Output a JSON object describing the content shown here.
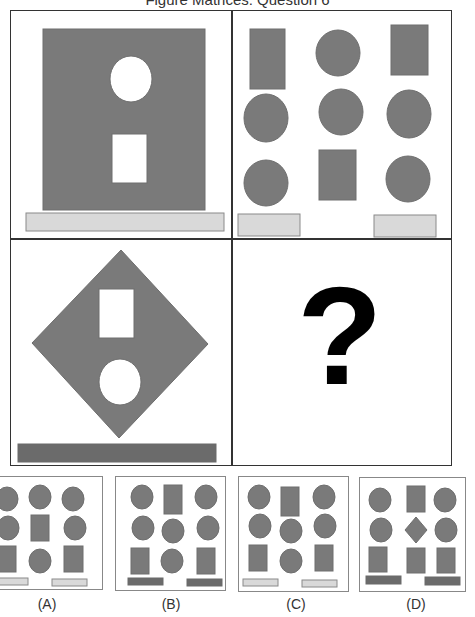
{
  "title": "Figure Matrices: Question 6",
  "colors": {
    "shape_fill": "#7a7a7a",
    "shape_stroke": "#6e6e6e",
    "light_bar_fill": "#d9d9d9",
    "light_bar_stroke": "#8a8a8a",
    "dark_bar_fill": "#6b6b6b",
    "hole_fill": "#ffffff",
    "border": "#333333"
  },
  "matrix": {
    "top_left": {
      "description": "Large gray square containing a white circle above a white rectangle, light bar below",
      "shapes": [
        {
          "type": "rect",
          "x": 32,
          "y": 18,
          "w": 162,
          "h": 181,
          "fill": "shape"
        },
        {
          "type": "ellipse",
          "cx": 120,
          "cy": 68,
          "rx": 21,
          "ry": 23,
          "fill": "hole"
        },
        {
          "type": "rect",
          "x": 101,
          "y": 123,
          "w": 35,
          "h": 49,
          "fill": "hole"
        },
        {
          "type": "rect",
          "x": 15,
          "y": 202,
          "w": 198,
          "h": 18,
          "fill": "light_bar"
        }
      ]
    },
    "top_right": {
      "description": "3x3 grid of gray rectangles and circles, two light bars below",
      "shapes": [
        {
          "type": "rect",
          "x": 17,
          "y": 18,
          "w": 35,
          "h": 60,
          "fill": "shape"
        },
        {
          "type": "ellipse",
          "cx": 105,
          "cy": 42,
          "rx": 22,
          "ry": 23,
          "fill": "shape"
        },
        {
          "type": "rect",
          "x": 158,
          "y": 14,
          "w": 37,
          "h": 50,
          "fill": "shape"
        },
        {
          "type": "ellipse",
          "cx": 33,
          "cy": 107,
          "rx": 22,
          "ry": 24,
          "fill": "shape"
        },
        {
          "type": "ellipse",
          "cx": 108,
          "cy": 101,
          "rx": 22,
          "ry": 23,
          "fill": "shape"
        },
        {
          "type": "ellipse",
          "cx": 176,
          "cy": 103,
          "rx": 22,
          "ry": 24,
          "fill": "shape"
        },
        {
          "type": "ellipse",
          "cx": 33,
          "cy": 172,
          "rx": 22,
          "ry": 23,
          "fill": "shape"
        },
        {
          "type": "rect",
          "x": 86,
          "y": 139,
          "w": 37,
          "h": 50,
          "fill": "shape"
        },
        {
          "type": "ellipse",
          "cx": 175,
          "cy": 168,
          "rx": 22,
          "ry": 23,
          "fill": "shape"
        },
        {
          "type": "rect",
          "x": 5,
          "y": 203,
          "w": 62,
          "h": 22,
          "fill": "light_bar"
        },
        {
          "type": "rect",
          "x": 141,
          "y": 204,
          "w": 62,
          "h": 22,
          "fill": "light_bar"
        }
      ]
    },
    "bottom_left": {
      "description": "Gray diamond containing a white rectangle above a white circle, dark bar below",
      "shapes": [
        {
          "type": "polygon",
          "points": "110,10 197,104 108,198 21,103",
          "fill": "shape"
        },
        {
          "type": "rect",
          "x": 88,
          "y": 49,
          "w": 35,
          "h": 49,
          "fill": "hole"
        },
        {
          "type": "ellipse",
          "cx": 109,
          "cy": 142,
          "rx": 21,
          "ry": 23,
          "fill": "hole"
        },
        {
          "type": "rect",
          "x": 7,
          "y": 204,
          "w": 198,
          "h": 18,
          "fill": "dark_bar"
        }
      ]
    },
    "bottom_right": {
      "description": "Missing cell",
      "symbol": "?"
    }
  },
  "options": [
    {
      "label": "(A)",
      "shapes": [
        {
          "type": "ellipse",
          "cx": 12,
          "cy": 22,
          "rx": 11,
          "ry": 12,
          "fill": "shape"
        },
        {
          "type": "ellipse",
          "cx": 45,
          "cy": 20,
          "rx": 11,
          "ry": 12,
          "fill": "shape"
        },
        {
          "type": "ellipse",
          "cx": 78,
          "cy": 22,
          "rx": 11,
          "ry": 12,
          "fill": "shape"
        },
        {
          "type": "ellipse",
          "cx": 13,
          "cy": 51,
          "rx": 11,
          "ry": 12,
          "fill": "shape"
        },
        {
          "type": "rect",
          "x": 36,
          "y": 38,
          "w": 18,
          "h": 26,
          "fill": "shape"
        },
        {
          "type": "ellipse",
          "cx": 80,
          "cy": 51,
          "rx": 11,
          "ry": 12,
          "fill": "shape"
        },
        {
          "type": "rect",
          "x": 2,
          "y": 69,
          "w": 19,
          "h": 26,
          "fill": "shape"
        },
        {
          "type": "ellipse",
          "cx": 45,
          "cy": 84,
          "rx": 11,
          "ry": 12,
          "fill": "shape"
        },
        {
          "type": "rect",
          "x": 69,
          "y": 69,
          "w": 19,
          "h": 26,
          "fill": "shape"
        },
        {
          "type": "rect",
          "x": -2,
          "y": 101,
          "w": 35,
          "h": 7,
          "fill": "light_bar"
        },
        {
          "type": "rect",
          "x": 57,
          "y": 102,
          "w": 35,
          "h": 7,
          "fill": "light_bar"
        }
      ]
    },
    {
      "label": "(B)",
      "shapes": [
        {
          "type": "ellipse",
          "cx": 26,
          "cy": 20,
          "rx": 11,
          "ry": 12,
          "fill": "shape"
        },
        {
          "type": "rect",
          "x": 48,
          "y": 8,
          "w": 18,
          "h": 29,
          "fill": "shape"
        },
        {
          "type": "ellipse",
          "cx": 90,
          "cy": 20,
          "rx": 11,
          "ry": 12,
          "fill": "shape"
        },
        {
          "type": "ellipse",
          "cx": 27,
          "cy": 51,
          "rx": 11,
          "ry": 12,
          "fill": "shape"
        },
        {
          "type": "ellipse",
          "cx": 57,
          "cy": 54,
          "rx": 11,
          "ry": 12,
          "fill": "shape"
        },
        {
          "type": "ellipse",
          "cx": 92,
          "cy": 51,
          "rx": 11,
          "ry": 12,
          "fill": "shape"
        },
        {
          "type": "rect",
          "x": 15,
          "y": 71,
          "w": 18,
          "h": 26,
          "fill": "shape"
        },
        {
          "type": "ellipse",
          "cx": 56,
          "cy": 84,
          "rx": 11,
          "ry": 12,
          "fill": "shape"
        },
        {
          "type": "rect",
          "x": 81,
          "y": 71,
          "w": 18,
          "h": 26,
          "fill": "shape"
        },
        {
          "type": "rect",
          "x": 12,
          "y": 101,
          "w": 35,
          "h": 7,
          "fill": "dark_bar"
        },
        {
          "type": "rect",
          "x": 71,
          "y": 102,
          "w": 35,
          "h": 7,
          "fill": "dark_bar"
        }
      ]
    },
    {
      "label": "(C)",
      "shapes": [
        {
          "type": "ellipse",
          "cx": 20,
          "cy": 20,
          "rx": 11,
          "ry": 12,
          "fill": "shape"
        },
        {
          "type": "rect",
          "x": 42,
          "y": 10,
          "w": 18,
          "h": 29,
          "fill": "shape"
        },
        {
          "type": "ellipse",
          "cx": 85,
          "cy": 20,
          "rx": 11,
          "ry": 12,
          "fill": "shape"
        },
        {
          "type": "ellipse",
          "cx": 21,
          "cy": 49,
          "rx": 11,
          "ry": 12,
          "fill": "shape"
        },
        {
          "type": "ellipse",
          "cx": 52,
          "cy": 54,
          "rx": 11,
          "ry": 12,
          "fill": "shape"
        },
        {
          "type": "ellipse",
          "cx": 86,
          "cy": 49,
          "rx": 11,
          "ry": 12,
          "fill": "shape"
        },
        {
          "type": "rect",
          "x": 10,
          "y": 68,
          "w": 18,
          "h": 26,
          "fill": "shape"
        },
        {
          "type": "ellipse",
          "cx": 52,
          "cy": 84,
          "rx": 11,
          "ry": 12,
          "fill": "shape"
        },
        {
          "type": "rect",
          "x": 76,
          "y": 68,
          "w": 18,
          "h": 26,
          "fill": "shape"
        },
        {
          "type": "rect",
          "x": 4,
          "y": 102,
          "w": 35,
          "h": 7,
          "fill": "light_bar"
        },
        {
          "type": "rect",
          "x": 63,
          "y": 103,
          "w": 35,
          "h": 7,
          "fill": "light_bar"
        }
      ]
    },
    {
      "label": "(D)",
      "shapes": [
        {
          "type": "ellipse",
          "cx": 20,
          "cy": 22,
          "rx": 11,
          "ry": 12,
          "fill": "shape"
        },
        {
          "type": "rect",
          "x": 47,
          "y": 8,
          "w": 18,
          "h": 26,
          "fill": "shape"
        },
        {
          "type": "ellipse",
          "cx": 85,
          "cy": 22,
          "rx": 11,
          "ry": 12,
          "fill": "shape"
        },
        {
          "type": "ellipse",
          "cx": 21,
          "cy": 52,
          "rx": 11,
          "ry": 12,
          "fill": "shape"
        },
        {
          "type": "polygon",
          "points": "56,39 67,52 56,65 45,52",
          "fill": "shape"
        },
        {
          "type": "ellipse",
          "cx": 86,
          "cy": 52,
          "rx": 11,
          "ry": 12,
          "fill": "shape"
        },
        {
          "type": "rect",
          "x": 9,
          "y": 69,
          "w": 18,
          "h": 25,
          "fill": "shape"
        },
        {
          "type": "rect",
          "x": 47,
          "y": 70,
          "w": 18,
          "h": 25,
          "fill": "shape"
        },
        {
          "type": "rect",
          "x": 77,
          "y": 70,
          "w": 18,
          "h": 25,
          "fill": "shape"
        },
        {
          "type": "rect",
          "x": 6,
          "y": 98,
          "w": 35,
          "h": 8,
          "fill": "dark_bar"
        },
        {
          "type": "rect",
          "x": 65,
          "y": 99,
          "w": 35,
          "h": 8,
          "fill": "dark_bar"
        }
      ]
    }
  ]
}
